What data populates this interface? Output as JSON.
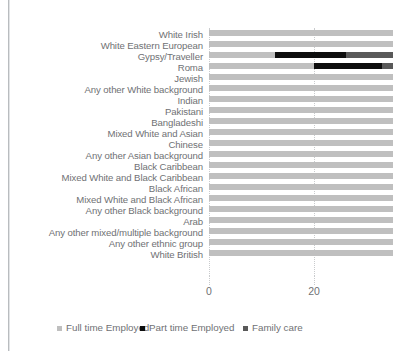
{
  "chart_data": {
    "type": "bar",
    "orientation": "horizontal",
    "stacked": true,
    "title": "",
    "subtitle": "",
    "xlabel": "",
    "ylabel": "",
    "xlim": [
      0,
      35
    ],
    "grid": true,
    "grid_axis": "x",
    "legend_position": "bottom",
    "xticks": [
      0,
      20
    ],
    "xtick_labels": [
      "0",
      "20"
    ],
    "categories": [
      "White Irish",
      "White Eastern European",
      "Gypsy/Traveller",
      "Roma",
      "Jewish",
      "Any other White background",
      "Indian",
      "Pakistani",
      "Bangladeshi",
      "Mixed White and Asian",
      "Chinese",
      "Any other Asian background",
      "Black Caribbean",
      "Mixed White and Black Caribbean",
      "Black African",
      "Mixed White and Black African",
      "Any other Black background",
      "Arab",
      "Any other mixed/multiple background",
      "Any other ethnic group",
      "White British"
    ],
    "series": [
      {
        "name": "Full time Employed",
        "color": "#bfbfbf",
        "values": [
          35,
          35,
          12.5,
          20,
          35,
          35,
          35,
          35,
          35,
          35,
          35,
          35,
          35,
          35,
          35,
          35,
          35,
          35,
          35,
          35,
          35
        ]
      },
      {
        "name": "Part time Employed",
        "color": "#0d0d0d",
        "values": [
          0,
          0,
          13.5,
          13,
          0,
          0,
          0,
          0,
          0,
          0,
          0,
          0,
          0,
          0,
          0,
          0,
          0,
          0,
          0,
          0,
          0
        ]
      },
      {
        "name": "Family care",
        "color": "#595959",
        "values": [
          0,
          0,
          9,
          2,
          0,
          0,
          0,
          0,
          0,
          0,
          0,
          0,
          0,
          0,
          0,
          0,
          0,
          0,
          0,
          0,
          0
        ]
      }
    ]
  },
  "legend": {
    "items": [
      {
        "label": "Full time Employed",
        "color": "#bfbfbf"
      },
      {
        "label": "Part time Employed",
        "color": "#0d0d0d"
      },
      {
        "label": "Family care",
        "color": "#595959"
      }
    ]
  },
  "colors": {
    "full_time": "#bfbfbf",
    "part_time": "#0d0d0d",
    "family_care": "#595959",
    "text": "#6f7174",
    "grid": "#c9cbcd",
    "background": "#ffffff"
  }
}
